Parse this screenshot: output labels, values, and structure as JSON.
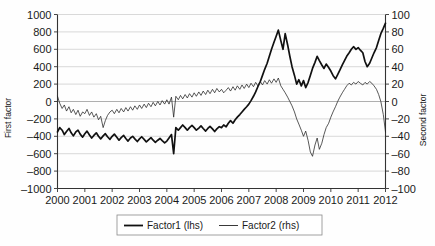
{
  "chart_data": {
    "type": "line",
    "title": "",
    "xlabel": "",
    "ylabel": "First factor",
    "y2label": "Second factor",
    "grid": true,
    "legend_position": "bottom-center",
    "xlim": [
      2000,
      2012
    ],
    "ylim": [
      -1000,
      1000
    ],
    "y2lim": [
      -100,
      100
    ],
    "xticks": [
      "2000",
      "2001",
      "2002",
      "2003",
      "2004",
      "2005",
      "2006",
      "2007",
      "2008",
      "2009",
      "2010",
      "2011",
      "2012"
    ],
    "yticks": [
      "1000",
      "800",
      "600",
      "400",
      "200",
      "0",
      "-200",
      "-400",
      "-600",
      "-800",
      "-1000"
    ],
    "y2ticks": [
      "100",
      "80",
      "60",
      "40",
      "20",
      "0",
      "-20",
      "-40",
      "-60",
      "-80",
      "-100"
    ],
    "series": [
      {
        "name": "Factor1 (lhs)",
        "axis": "left",
        "style": "thick",
        "x": [
          2000.0,
          2000.08,
          2000.17,
          2000.25,
          2000.33,
          2000.42,
          2000.5,
          2000.58,
          2000.67,
          2000.75,
          2000.83,
          2000.92,
          2001.0,
          2001.08,
          2001.17,
          2001.25,
          2001.33,
          2001.42,
          2001.5,
          2001.58,
          2001.67,
          2001.75,
          2001.83,
          2001.92,
          2002.0,
          2002.08,
          2002.17,
          2002.25,
          2002.33,
          2002.42,
          2002.5,
          2002.58,
          2002.67,
          2002.75,
          2002.83,
          2002.92,
          2003.0,
          2003.08,
          2003.17,
          2003.25,
          2003.33,
          2003.42,
          2003.5,
          2003.58,
          2003.67,
          2003.75,
          2003.83,
          2003.92,
          2004.0,
          2004.08,
          2004.17,
          2004.25,
          2004.33,
          2004.42,
          2004.5,
          2004.58,
          2004.67,
          2004.75,
          2004.83,
          2004.92,
          2005.0,
          2005.08,
          2005.17,
          2005.25,
          2005.33,
          2005.42,
          2005.5,
          2005.58,
          2005.67,
          2005.75,
          2005.83,
          2005.92,
          2006.0,
          2006.08,
          2006.17,
          2006.25,
          2006.33,
          2006.42,
          2006.5,
          2006.58,
          2006.67,
          2006.75,
          2006.83,
          2006.92,
          2007.0,
          2007.08,
          2007.17,
          2007.25,
          2007.33,
          2007.42,
          2007.5,
          2007.58,
          2007.67,
          2007.75,
          2007.83,
          2007.92,
          2008.0,
          2008.08,
          2008.17,
          2008.25,
          2008.33,
          2008.42,
          2008.5,
          2008.58,
          2008.67,
          2008.75,
          2008.83,
          2008.92,
          2009.0,
          2009.08,
          2009.17,
          2009.25,
          2009.33,
          2009.42,
          2009.5,
          2009.58,
          2009.67,
          2009.75,
          2009.83,
          2009.92,
          2010.0,
          2010.08,
          2010.17,
          2010.25,
          2010.33,
          2010.42,
          2010.5,
          2010.58,
          2010.67,
          2010.75,
          2010.83,
          2010.92,
          2011.0,
          2011.08,
          2011.17,
          2011.25,
          2011.33,
          2011.42,
          2011.5,
          2011.58,
          2011.67,
          2011.75,
          2011.83,
          2011.92,
          2012.0
        ],
        "values": [
          -350,
          -300,
          -330,
          -380,
          -345,
          -310,
          -360,
          -395,
          -350,
          -330,
          -375,
          -410,
          -370,
          -340,
          -385,
          -420,
          -390,
          -360,
          -400,
          -430,
          -395,
          -370,
          -405,
          -435,
          -400,
          -375,
          -410,
          -445,
          -415,
          -390,
          -425,
          -455,
          -420,
          -400,
          -430,
          -460,
          -430,
          -405,
          -435,
          -465,
          -440,
          -415,
          -445,
          -470,
          -445,
          -425,
          -450,
          -475,
          -455,
          -420,
          -380,
          -600,
          -300,
          -330,
          -300,
          -270,
          -300,
          -330,
          -300,
          -275,
          -300,
          -330,
          -305,
          -280,
          -310,
          -340,
          -310,
          -285,
          -315,
          -345,
          -315,
          -290,
          -300,
          -270,
          -290,
          -250,
          -220,
          -250,
          -210,
          -180,
          -150,
          -120,
          -90,
          -60,
          -30,
          10,
          60,
          110,
          170,
          230,
          300,
          370,
          440,
          520,
          600,
          680,
          750,
          820,
          700,
          600,
          780,
          650,
          520,
          400,
          300,
          200,
          250,
          180,
          240,
          160,
          220,
          300,
          380,
          450,
          520,
          470,
          420,
          380,
          430,
          390,
          350,
          300,
          260,
          310,
          360,
          420,
          470,
          520,
          560,
          600,
          630,
          600,
          620,
          590,
          560,
          460,
          400,
          440,
          500,
          560,
          620,
          700,
          780,
          840,
          900
        ]
      },
      {
        "name": "Factor2 (rhs)",
        "axis": "right",
        "style": "thin",
        "x": [
          2000.0,
          2000.08,
          2000.17,
          2000.25,
          2000.33,
          2000.42,
          2000.5,
          2000.58,
          2000.67,
          2000.75,
          2000.83,
          2000.92,
          2001.0,
          2001.08,
          2001.17,
          2001.25,
          2001.33,
          2001.42,
          2001.5,
          2001.58,
          2001.67,
          2001.75,
          2001.83,
          2001.92,
          2002.0,
          2002.08,
          2002.17,
          2002.25,
          2002.33,
          2002.42,
          2002.5,
          2002.58,
          2002.67,
          2002.75,
          2002.83,
          2002.92,
          2003.0,
          2003.08,
          2003.17,
          2003.25,
          2003.33,
          2003.42,
          2003.5,
          2003.58,
          2003.67,
          2003.75,
          2003.83,
          2003.92,
          2004.0,
          2004.08,
          2004.17,
          2004.25,
          2004.33,
          2004.42,
          2004.5,
          2004.58,
          2004.67,
          2004.75,
          2004.83,
          2004.92,
          2005.0,
          2005.08,
          2005.17,
          2005.25,
          2005.33,
          2005.42,
          2005.5,
          2005.58,
          2005.67,
          2005.75,
          2005.83,
          2005.92,
          2006.0,
          2006.08,
          2006.17,
          2006.25,
          2006.33,
          2006.42,
          2006.5,
          2006.58,
          2006.67,
          2006.75,
          2006.83,
          2006.92,
          2007.0,
          2007.08,
          2007.17,
          2007.25,
          2007.33,
          2007.42,
          2007.5,
          2007.58,
          2007.67,
          2007.75,
          2007.83,
          2007.92,
          2008.0,
          2008.08,
          2008.17,
          2008.25,
          2008.33,
          2008.42,
          2008.5,
          2008.58,
          2008.67,
          2008.75,
          2008.83,
          2008.92,
          2009.0,
          2009.08,
          2009.17,
          2009.25,
          2009.33,
          2009.42,
          2009.5,
          2009.58,
          2009.67,
          2009.75,
          2009.83,
          2009.92,
          2010.0,
          2010.08,
          2010.17,
          2010.25,
          2010.33,
          2010.42,
          2010.5,
          2010.58,
          2010.67,
          2010.75,
          2010.83,
          2010.92,
          2011.0,
          2011.08,
          2011.17,
          2011.25,
          2011.33,
          2011.42,
          2011.5,
          2011.58,
          2011.67,
          2011.75,
          2011.83,
          2011.92,
          2012.0
        ],
        "values": [
          6,
          -2,
          -8,
          -4,
          -11,
          -6,
          -13,
          -9,
          -15,
          -10,
          -17,
          -12,
          -14,
          -9,
          -16,
          -12,
          -18,
          -14,
          -21,
          -17,
          -30,
          -22,
          -16,
          -12,
          -10,
          -14,
          -9,
          -13,
          -8,
          -12,
          -7,
          -11,
          -6,
          -10,
          -5,
          -9,
          -4,
          -8,
          -3,
          -7,
          -2,
          -6,
          -1,
          -5,
          0,
          -4,
          1,
          -3,
          2,
          -3,
          5,
          -18,
          6,
          2,
          7,
          3,
          8,
          4,
          9,
          5,
          10,
          6,
          11,
          7,
          12,
          8,
          13,
          9,
          14,
          10,
          15,
          11,
          14,
          10,
          13,
          16,
          12,
          17,
          13,
          18,
          14,
          19,
          15,
          20,
          16,
          21,
          17,
          22,
          18,
          23,
          19,
          24,
          20,
          25,
          21,
          26,
          22,
          27,
          18,
          14,
          10,
          5,
          0,
          -5,
          -12,
          -20,
          -26,
          -33,
          -40,
          -34,
          -45,
          -58,
          -63,
          -50,
          -42,
          -55,
          -48,
          -38,
          -30,
          -25,
          -18,
          -12,
          -6,
          0,
          5,
          10,
          14,
          18,
          21,
          19,
          22,
          20,
          23,
          21,
          19,
          22,
          20,
          23,
          21,
          18,
          14,
          8,
          0,
          -15,
          -35
        ]
      }
    ]
  },
  "axes": {
    "left_title": "First factor",
    "right_title": "Second factor"
  },
  "legend": {
    "entries": [
      {
        "label": "Factor1 (lhs)",
        "style": "thick"
      },
      {
        "label": "Factor2 (rhs)",
        "style": "thin"
      }
    ]
  },
  "colors": {
    "primary_line": "#111111",
    "secondary_line": "#222222",
    "gridline": "#c9c9c9",
    "axis": "#333333",
    "background": "#fefefe"
  }
}
